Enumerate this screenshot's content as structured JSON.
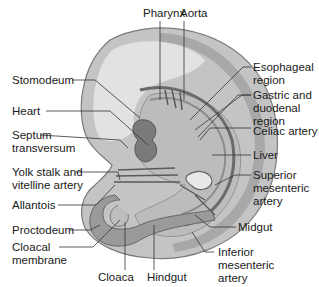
{
  "diagram": {
    "colors": {
      "outer_embryo": "#c4c4c4",
      "outer_rim": "#9a9a9a",
      "inner_cavity": "#e2e2e2",
      "mesoderm": "#b0b0b0",
      "gut_tube": "#8c8c8c",
      "dark_tissue": "#6a6a6a",
      "leader_line": "#333333",
      "text": "#1a1a1a",
      "background": "#ffffff"
    },
    "labels": {
      "pharynx": "Pharynx",
      "aorta": "Aorta",
      "stomodeum": "Stomodeum",
      "esophageal_1": "Esophageal",
      "esophageal_2": "region",
      "gastric_1": "Gastric and",
      "gastric_2": "duodenal",
      "gastric_3": "region",
      "heart": "Heart",
      "septum_1": "Septum",
      "septum_2": "transversum",
      "celiac": "Celiac artery",
      "liver": "Liver",
      "yolk_1": "Yolk stalk and",
      "yolk_2": "vitelline artery",
      "superior_1": "Superior",
      "superior_2": "mesenteric",
      "superior_3": "artery",
      "allantois": "Allantois",
      "proctodeum": "Proctodeum",
      "midgut": "Midgut",
      "cloacal_1": "Cloacal",
      "cloacal_2": "membrane",
      "inferior_1": "Inferior",
      "inferior_2": "mesenteric",
      "inferior_3": "artery",
      "cloaca": "Cloaca",
      "hindgut": "Hindgut"
    }
  }
}
